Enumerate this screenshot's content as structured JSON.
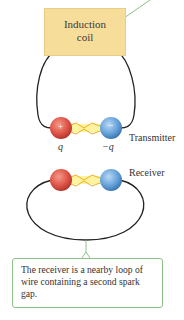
{
  "induction_coil": {
    "label_line1": "Induction",
    "label_line2": "coil",
    "fill": "#f7dd9a"
  },
  "transmitter": {
    "label": "Transmitter",
    "positive_sphere": {
      "sign": "+",
      "charge": "q",
      "color": "#e0574a"
    },
    "negative_sphere": {
      "sign": "−",
      "charge": "−q",
      "color": "#6aa5dc"
    }
  },
  "receiver": {
    "label": "Receiver"
  },
  "callout": {
    "text": "The receiver is a nearby loop of wire containing a second spark gap.",
    "border_color": "#8cc28a"
  }
}
